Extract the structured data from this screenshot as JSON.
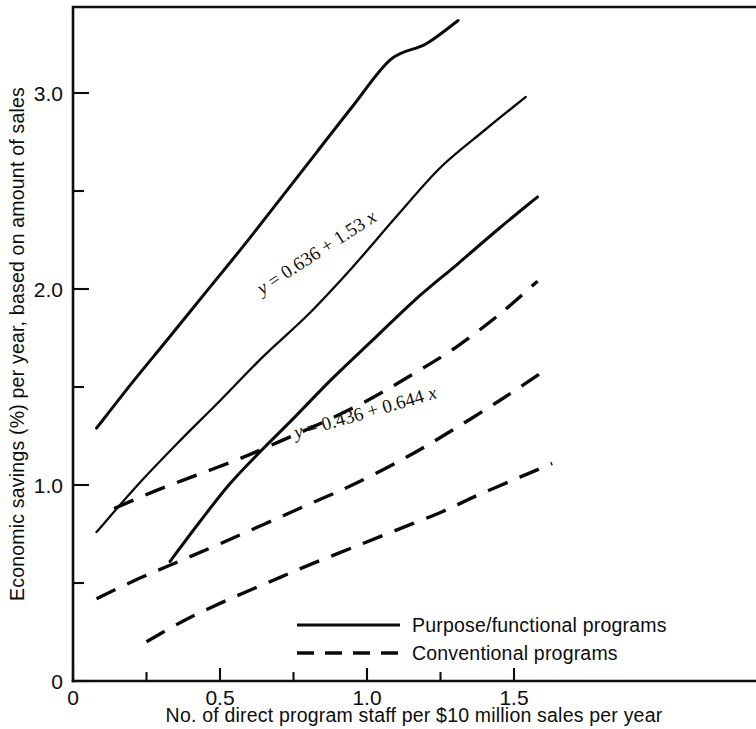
{
  "chart_data": {
    "type": "line",
    "title": "",
    "xlabel": "No. of direct program staff per $10 million sales per year",
    "ylabel": "Economic savings (%) per year, based on amount of sales",
    "xlim": [
      0,
      1.7
    ],
    "ylim": [
      0,
      3.45
    ],
    "grid": false,
    "legend_position": "bottom-center",
    "x_ticks": [
      {
        "value": 0,
        "label": "0"
      },
      {
        "value": 0.25,
        "label": ""
      },
      {
        "value": 0.5,
        "label": "0.5"
      },
      {
        "value": 0.75,
        "label": ""
      },
      {
        "value": 1.0,
        "label": "1.0"
      },
      {
        "value": 1.25,
        "label": ""
      },
      {
        "value": 1.5,
        "label": "1.5"
      }
    ],
    "y_ticks": [
      {
        "value": 0,
        "label": "0"
      },
      {
        "value": 0.5,
        "label": ""
      },
      {
        "value": 1.0,
        "label": "1.0"
      },
      {
        "value": 1.5,
        "label": ""
      },
      {
        "value": 2.0,
        "label": "2.0"
      },
      {
        "value": 2.5,
        "label": ""
      },
      {
        "value": 3.0,
        "label": "3.0"
      }
    ],
    "legend": [
      {
        "label": "Purpose/functional  programs",
        "style": "solid"
      },
      {
        "label": "Conventional  programs",
        "style": "dashed"
      }
    ],
    "annotations": [
      {
        "text": "y = 0.636 + 1.53 x",
        "var_y": "y",
        "body": " = 0.636 + 1.53 ",
        "var_x": "x",
        "for_series": "purpose-functional-fit",
        "x": 0.84,
        "y": 2.16,
        "rotation": -33
      },
      {
        "text": "y = 0.436 + 0.644 x",
        "var_y": "y",
        "body": " = 0.436 + 0.644 ",
        "var_x": "x",
        "for_series": "conventional-fit",
        "x": 1.0,
        "y": 1.34,
        "rotation": -16
      }
    ],
    "series": [
      {
        "name": "Purpose/functional upper confidence band",
        "id": "purpose-functional-upper",
        "style": "solid",
        "points": [
          [
            0.08,
            1.29
          ],
          [
            0.2,
            1.52
          ],
          [
            0.32,
            1.74
          ],
          [
            0.45,
            1.98
          ],
          [
            0.58,
            2.22
          ],
          [
            0.7,
            2.45
          ],
          [
            0.83,
            2.7
          ],
          [
            0.95,
            2.93
          ],
          [
            1.08,
            3.17
          ],
          [
            1.2,
            3.25
          ],
          [
            1.31,
            3.37
          ]
        ]
      },
      {
        "name": "Purpose/functional regression line",
        "id": "purpose-functional-fit",
        "style": "solid",
        "points": [
          [
            0.08,
            0.76
          ],
          [
            0.22,
            1.0
          ],
          [
            0.36,
            1.22
          ],
          [
            0.5,
            1.43
          ],
          [
            0.65,
            1.66
          ],
          [
            0.8,
            1.87
          ],
          [
            0.95,
            2.11
          ],
          [
            1.1,
            2.37
          ],
          [
            1.25,
            2.62
          ],
          [
            1.4,
            2.81
          ],
          [
            1.54,
            2.98
          ]
        ]
      },
      {
        "name": "Purpose/functional lower confidence band",
        "id": "purpose-functional-lower",
        "style": "solid",
        "points": [
          [
            0.33,
            0.61
          ],
          [
            0.43,
            0.81
          ],
          [
            0.53,
            1.0
          ],
          [
            0.63,
            1.16
          ],
          [
            0.75,
            1.34
          ],
          [
            0.88,
            1.54
          ],
          [
            1.02,
            1.74
          ],
          [
            1.16,
            1.94
          ],
          [
            1.31,
            2.13
          ],
          [
            1.45,
            2.31
          ],
          [
            1.58,
            2.47
          ]
        ]
      },
      {
        "name": "Conventional upper confidence band",
        "id": "conventional-upper",
        "style": "dashed",
        "points": [
          [
            0.14,
            0.88
          ],
          [
            0.28,
            0.97
          ],
          [
            0.42,
            1.05
          ],
          [
            0.56,
            1.13
          ],
          [
            0.7,
            1.22
          ],
          [
            0.85,
            1.32
          ],
          [
            1.0,
            1.43
          ],
          [
            1.15,
            1.56
          ],
          [
            1.3,
            1.7
          ],
          [
            1.45,
            1.87
          ],
          [
            1.58,
            2.04
          ]
        ]
      },
      {
        "name": "Conventional regression line",
        "id": "conventional-fit",
        "style": "dashed",
        "points": [
          [
            0.08,
            0.42
          ],
          [
            0.22,
            0.52
          ],
          [
            0.36,
            0.61
          ],
          [
            0.5,
            0.7
          ],
          [
            0.65,
            0.8
          ],
          [
            0.8,
            0.9
          ],
          [
            0.95,
            1.0
          ],
          [
            1.12,
            1.13
          ],
          [
            1.28,
            1.27
          ],
          [
            1.45,
            1.43
          ],
          [
            1.6,
            1.58
          ]
        ]
      },
      {
        "name": "Conventional lower confidence band",
        "id": "conventional-lower",
        "style": "dashed",
        "points": [
          [
            0.25,
            0.2
          ],
          [
            0.38,
            0.31
          ],
          [
            0.52,
            0.41
          ],
          [
            0.66,
            0.5
          ],
          [
            0.8,
            0.59
          ],
          [
            0.95,
            0.68
          ],
          [
            1.1,
            0.77
          ],
          [
            1.25,
            0.86
          ],
          [
            1.38,
            0.95
          ],
          [
            1.52,
            1.04
          ],
          [
            1.63,
            1.11
          ]
        ]
      }
    ]
  },
  "axes": {
    "y_axis_title": "Economic savings (%) per year, based on amount of sales",
    "x_axis_title": "No. of direct program staff per $10 million sales per year"
  },
  "legend": {
    "solid_label": "Purpose/functional  programs",
    "dashed_label": "Conventional  programs"
  },
  "colors": {
    "ink": "#0d0d0d",
    "background": "#ffffff"
  }
}
